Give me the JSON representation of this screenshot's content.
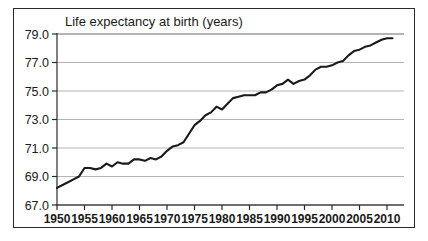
{
  "chart_data": {
    "type": "line",
    "title": "Life expectancy at birth (years)",
    "xlabel": "",
    "ylabel": "",
    "xlim": [
      1950,
      2011
    ],
    "ylim": [
      67.0,
      79.0
    ],
    "grid": true,
    "legend": null,
    "y_ticks": [
      "67.0",
      "69.0",
      "71.0",
      "73.0",
      "75.0",
      "77.0",
      "79.0"
    ],
    "y_tick_values": [
      67.0,
      69.0,
      71.0,
      73.0,
      75.0,
      77.0,
      79.0
    ],
    "x_ticks": [
      "1950",
      "1955",
      "1960",
      "1965",
      "1970",
      "1975",
      "1980",
      "1985",
      "1990",
      "1995",
      "2000",
      "2005",
      "2010"
    ],
    "x_tick_values": [
      1950,
      1955,
      1960,
      1965,
      1970,
      1975,
      1980,
      1985,
      1990,
      1995,
      2000,
      2005,
      2010
    ],
    "series": [
      {
        "name": "Life expectancy at birth",
        "color": "#1a1a1a",
        "x": [
          1950,
          1951,
          1952,
          1953,
          1954,
          1955,
          1956,
          1957,
          1958,
          1959,
          1960,
          1961,
          1962,
          1963,
          1964,
          1965,
          1966,
          1967,
          1968,
          1969,
          1970,
          1971,
          1972,
          1973,
          1974,
          1975,
          1976,
          1977,
          1978,
          1979,
          1980,
          1981,
          1982,
          1983,
          1984,
          1985,
          1986,
          1987,
          1988,
          1989,
          1990,
          1991,
          1992,
          1993,
          1994,
          1995,
          1996,
          1997,
          1998,
          1999,
          2000,
          2001,
          2002,
          2003,
          2004,
          2005,
          2006,
          2007,
          2008,
          2009,
          2010,
          2011
        ],
        "values": [
          68.2,
          68.4,
          68.6,
          68.8,
          69.0,
          69.6,
          69.6,
          69.5,
          69.6,
          69.9,
          69.7,
          70.0,
          69.9,
          69.9,
          70.2,
          70.2,
          70.1,
          70.3,
          70.2,
          70.4,
          70.8,
          71.1,
          71.2,
          71.4,
          72.0,
          72.6,
          72.9,
          73.3,
          73.5,
          73.9,
          73.7,
          74.1,
          74.5,
          74.6,
          74.7,
          74.7,
          74.7,
          74.9,
          74.9,
          75.1,
          75.4,
          75.5,
          75.8,
          75.5,
          75.7,
          75.8,
          76.1,
          76.5,
          76.7,
          76.7,
          76.8,
          77.0,
          77.1,
          77.5,
          77.8,
          77.9,
          78.1,
          78.2,
          78.4,
          78.6,
          78.7,
          78.7
        ]
      }
    ]
  },
  "axis": {
    "title_text": "Life expectancy at birth (years)"
  }
}
